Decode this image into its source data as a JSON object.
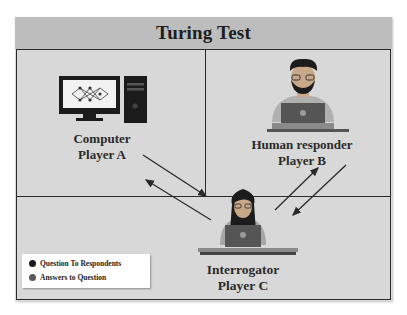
{
  "title": "Turing Test",
  "players": {
    "a": {
      "role": "Computer",
      "name": "Player A",
      "icon": "computer-icon"
    },
    "b": {
      "role": "Human responder",
      "name": "Player B",
      "icon": "human-laptop-icon"
    },
    "c": {
      "role": "Interrogator",
      "name": "Player C",
      "icon": "interrogator-laptop-icon"
    }
  },
  "legend": {
    "items": [
      {
        "label": "Question To Respondents",
        "color": "#1a1a1a"
      },
      {
        "label": "Answers to Question",
        "color": "#5a5a5a"
      }
    ]
  },
  "colors": {
    "background": "#dcdcdc",
    "title_bar": "#bdbdbd",
    "border": "#2a2a2a",
    "arrow": "#2a2a2a"
  }
}
